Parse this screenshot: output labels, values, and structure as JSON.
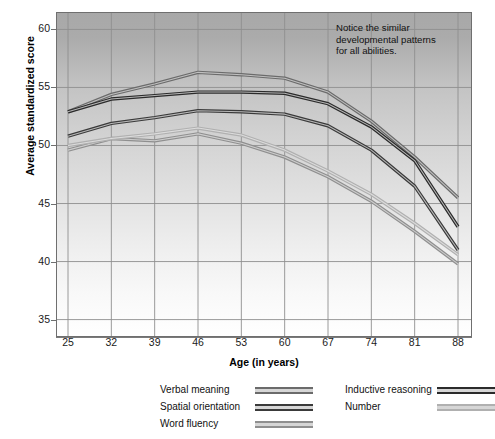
{
  "chart_data": {
    "type": "line",
    "title": "",
    "xlabel": "Age (in years)",
    "ylabel": "Average standardized score",
    "x": [
      25,
      32,
      39,
      46,
      53,
      60,
      67,
      74,
      81,
      88
    ],
    "xlim": [
      25,
      88
    ],
    "ylim": [
      33.5,
      61.5
    ],
    "xticks": [
      "25",
      "32",
      "39",
      "46",
      "53",
      "60",
      "67",
      "74",
      "81",
      "88"
    ],
    "yticks": [
      "60",
      "55",
      "50",
      "45",
      "40",
      "35"
    ],
    "ytick_values": [
      60,
      55,
      50,
      45,
      40,
      35
    ],
    "grid": true,
    "legend_position": "bottom",
    "annotation": "Notice the similar developmental patterns for all abilities.",
    "series": [
      {
        "name": "Verbal meaning",
        "color": "#6b6b6b",
        "values": [
          52.9,
          54.4,
          55.3,
          56.3,
          56.1,
          55.8,
          54.6,
          52.1,
          49.0,
          45.5
        ]
      },
      {
        "name": "Spatial orientation",
        "color": "#3a3a3a",
        "values": [
          50.8,
          51.9,
          52.4,
          53.0,
          52.9,
          52.7,
          51.7,
          49.6,
          46.5,
          41.0
        ]
      },
      {
        "name": "Word fluency",
        "color": "#8f8f8f",
        "values": [
          49.6,
          50.6,
          50.4,
          51.0,
          50.2,
          49.0,
          47.3,
          45.2,
          42.6,
          39.8
        ]
      },
      {
        "name": "Inductive reasoning",
        "color": "#2b2b2b",
        "values": [
          52.9,
          54.0,
          54.3,
          54.6,
          54.6,
          54.5,
          53.6,
          51.6,
          48.7,
          43.0
        ]
      },
      {
        "name": "Number",
        "color": "#b0b0b0",
        "values": [
          50.0,
          50.6,
          51.0,
          51.5,
          50.9,
          49.6,
          47.8,
          45.8,
          43.3,
          40.6
        ]
      }
    ]
  },
  "legend": {
    "items": [
      {
        "label": "Verbal meaning",
        "color": "#6b6b6b"
      },
      {
        "label": "Spatial orientation",
        "color": "#3a3a3a"
      },
      {
        "label": "Word fluency",
        "color": "#8f8f8f"
      },
      {
        "label": "Inductive reasoning",
        "color": "#2b2b2b"
      },
      {
        "label": "Number",
        "color": "#b0b0b0"
      }
    ]
  },
  "annotation": {
    "text": "Notice the similar developmental patterns for all abilities."
  },
  "axes": {
    "x_title": "Age (in years)",
    "y_title": "Average standardized score"
  }
}
